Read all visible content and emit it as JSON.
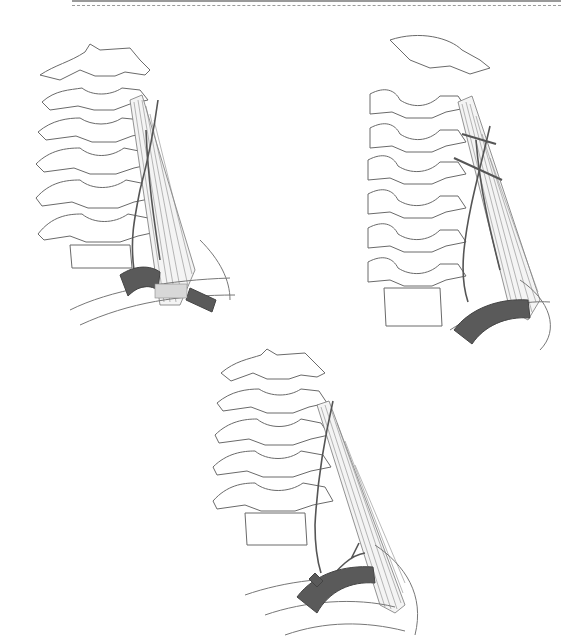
{
  "figure": {
    "panels": [
      {
        "id": "top-left",
        "label": ""
      },
      {
        "id": "top-right",
        "label": ""
      },
      {
        "id": "bottom-center",
        "label": ""
      }
    ],
    "colors": {
      "line": "#6a6a6a",
      "artery": "#5a5a5a",
      "background": "#ffffff",
      "band": "#d8d8d8"
    }
  }
}
